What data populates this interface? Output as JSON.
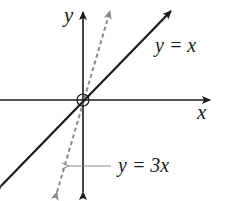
{
  "diagram": {
    "type": "coordinate-graph",
    "axes": {
      "x_label": "x",
      "y_label": "y",
      "origin_marker": "open-circle"
    },
    "lines": [
      {
        "id": "identity",
        "label": "y = x",
        "equation": "y = x",
        "slope": 1,
        "style": "solid",
        "color": "#1a1a1a"
      },
      {
        "id": "triple",
        "label": "y = 3x",
        "equation": "y = 3x",
        "slope": 3,
        "style": "dashed",
        "color": "#8a8a8a"
      }
    ],
    "annotations": [
      {
        "text": "y = 3x",
        "points_to": "triple",
        "arrow": "left"
      }
    ]
  },
  "labels": {
    "y_axis": "y",
    "x_axis": "x",
    "line1": "y = x",
    "line2": "y = 3x"
  },
  "colors": {
    "axis": "#1a1a1a",
    "line_solid": "#1a1a1a",
    "line_dashed": "#8a8a8a",
    "pointer": "#8a8a8a"
  }
}
